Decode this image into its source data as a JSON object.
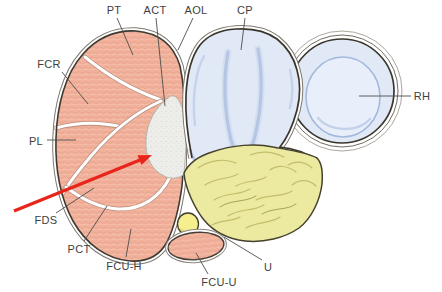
{
  "figure": {
    "kind": "anatomical cross-section diagram",
    "background": "#ffffff"
  },
  "labels": {
    "pt": "PT",
    "act": "ACT",
    "aol": "AOL",
    "cp": "CP",
    "fcr": "FCR",
    "pl": "PL",
    "rh": "RH",
    "fds": "FDS",
    "pct": "PCT",
    "fcu_h": "FCU-H",
    "fcu_u": "FCU-U",
    "u": "U"
  },
  "colors": {
    "muscle": "#f1b19b",
    "cartilage_fill": "#e1e9f7",
    "cartilage_shading": "#b5c6e4",
    "bone_fill": "#ece9a0",
    "bone_lines": "#c3be6c",
    "capsule_fill": "#edeeea",
    "small_oval_fill": "#f6ef8e",
    "outline": "#3e3a32",
    "arrow": "#e8251a",
    "label_text": "#413f3d"
  }
}
